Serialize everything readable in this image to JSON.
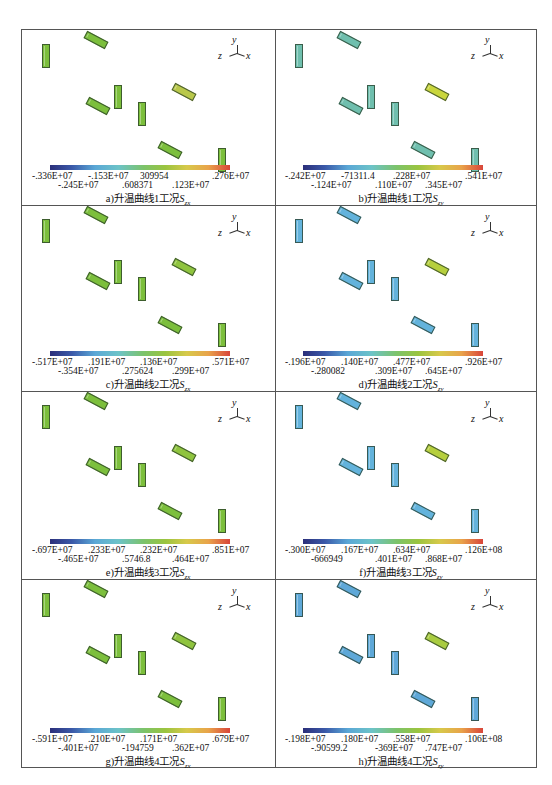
{
  "figure": {
    "axis_triad": {
      "y": "y",
      "z": "z",
      "x": "x"
    },
    "panels": [
      {
        "id": "a",
        "caption": "a)升温曲线1工况",
        "symbol": "S",
        "subscript": "zx",
        "ticks_row1": [
          "-.336E+07",
          "-.153E+07",
          "309954",
          ".276E+07"
        ],
        "ticks_row2": [
          "-.245E+07",
          ".608371",
          ".123E+07"
        ],
        "block_color": "#7cbf3c",
        "highlight_color": "#b9c84a"
      },
      {
        "id": "b",
        "caption": "b)升温曲线1工况",
        "symbol": "S",
        "subscript": "zy",
        "ticks_row1": [
          "-.242E+07",
          "-71311.4",
          ".228E+07",
          ".541E+07"
        ],
        "ticks_row2": [
          "-.124E+07",
          ".110E+07",
          ".345E+07"
        ],
        "block_color": "#6fbfae",
        "highlight_color": "#c9d63c"
      },
      {
        "id": "c",
        "caption": "c)升温曲线2工况",
        "symbol": "S",
        "subscript": "zx",
        "ticks_row1": [
          "-.517E+07",
          ".191E+07",
          ".136E+07",
          ".571E+07"
        ],
        "ticks_row2": [
          "-.354E+07",
          ".275624",
          ".299E+07"
        ],
        "block_color": "#7cbf3c",
        "highlight_color": "#8fc43e"
      },
      {
        "id": "d",
        "caption": "d)升温曲线2工况",
        "symbol": "S",
        "subscript": "zy",
        "ticks_row1": [
          "-.196E+07",
          ".140E+07",
          ".477E+07",
          ".926E+07"
        ],
        "ticks_row2": [
          "-.280082",
          ".309E+07",
          ".645E+07"
        ],
        "block_color": "#63b3dc",
        "highlight_color": "#b6cf3d"
      },
      {
        "id": "e",
        "caption": "e)升温曲线3工况",
        "symbol": "S",
        "subscript": "zx",
        "ticks_row1": [
          "-.697E+07",
          ".233E+07",
          ".232E+07",
          ".851E+07"
        ],
        "ticks_row2": [
          "-.465E+07",
          ".5746.8",
          ".464E+07"
        ],
        "block_color": "#7cbf3c",
        "highlight_color": "#8fc43e"
      },
      {
        "id": "f",
        "caption": "f)升温曲线3工况",
        "symbol": "S",
        "subscript": "zy",
        "ticks_row1": [
          "-.300E+07",
          ".167E+07",
          ".634E+07",
          ".126E+08"
        ],
        "ticks_row2": [
          "-666949",
          ".401E+07",
          ".868E+07"
        ],
        "block_color": "#63b3dc",
        "highlight_color": "#b6cf3d"
      },
      {
        "id": "g",
        "caption": "g)升温曲线4工况",
        "symbol": "S",
        "subscript": "zx",
        "ticks_row1": [
          "-.591E+07",
          ".210E+07",
          ".171E+07",
          ".679E+07"
        ],
        "ticks_row2": [
          "-.401E+07",
          "-194759",
          ".362E+07"
        ],
        "block_color": "#7cbf3c",
        "highlight_color": "#8fc43e"
      },
      {
        "id": "h",
        "caption": "h)升温曲线4工况",
        "symbol": "S",
        "subscript": "zy",
        "ticks_row1": [
          "-.198E+07",
          ".180E+07",
          ".558E+07",
          ".106E+08"
        ],
        "ticks_row2": [
          "-.90599.2",
          "-369E+07",
          ".747E+07"
        ],
        "block_color": "#5ea8d8",
        "highlight_color": "#a9cc40"
      }
    ]
  }
}
